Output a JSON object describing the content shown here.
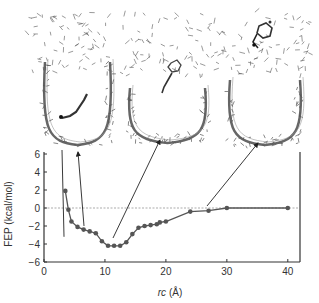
{
  "chart_data": {
    "type": "line",
    "title": "",
    "xlabel": "rc (Å)",
    "ylabel": "FEP (kcal/mol)",
    "xlim": [
      0,
      42
    ],
    "ylim": [
      -6,
      6
    ],
    "xticks": [
      0,
      10,
      20,
      30,
      40
    ],
    "yticks": [
      -6,
      -4,
      -2,
      0,
      2,
      4,
      6
    ],
    "reference_line": {
      "y": 0,
      "style": "dashed"
    },
    "series": [
      {
        "name": "FEP",
        "x": [
          3.5,
          4,
          4.5,
          5.5,
          6.5,
          7.5,
          8.5,
          9.5,
          10.5,
          11.5,
          12.5,
          13.5,
          14.5,
          15.5,
          16.5,
          17.5,
          18.5,
          19,
          20,
          24,
          27,
          30,
          40
        ],
        "y": [
          1.9,
          -0.2,
          -1.5,
          -2.1,
          -2.4,
          -2.6,
          -2.8,
          -3.7,
          -4.2,
          -4.2,
          -4.2,
          -3.8,
          -2.9,
          -2.2,
          -2.0,
          -1.9,
          -1.8,
          -1.6,
          -1.5,
          -0.4,
          -0.3,
          0.0,
          0.0
        ]
      }
    ],
    "grid": false,
    "legend": null,
    "annotations": [
      {
        "type": "arrow",
        "from_x": 6.5,
        "from_y": -2.1,
        "to_x": 5,
        "to_y": 7.5,
        "target": "left-structure"
      },
      {
        "type": "arrow",
        "from_x": 3,
        "from_y": 6.3,
        "to_x": 3.2,
        "to_y": 6.8,
        "target": "left-structure"
      },
      {
        "type": "arrow",
        "from_x": 11.3,
        "from_y": -3.3,
        "to_x": 19,
        "to_y": 12,
        "target": "middle-structure"
      },
      {
        "type": "arrow",
        "from_x": 27,
        "from_y": -0.5,
        "to_x": 37,
        "to_y": 12,
        "target": "right-structure"
      }
    ],
    "insets": [
      {
        "name": "left-structure",
        "description": "molecule inside pore bottom"
      },
      {
        "name": "middle-structure",
        "description": "molecule near pore entrance"
      },
      {
        "name": "right-structure",
        "description": "molecule in solvent above pore"
      }
    ]
  },
  "axis": {
    "xlabel_italic": "rc",
    "xlabel_unit": "(Å)",
    "ylabel": "FEP (kcal/mol)",
    "xtick_labels": [
      "0",
      "10",
      "20",
      "30",
      "40"
    ],
    "ytick_labels": [
      "6",
      "4",
      "2",
      "0",
      "−2",
      "−4",
      "−6"
    ]
  }
}
